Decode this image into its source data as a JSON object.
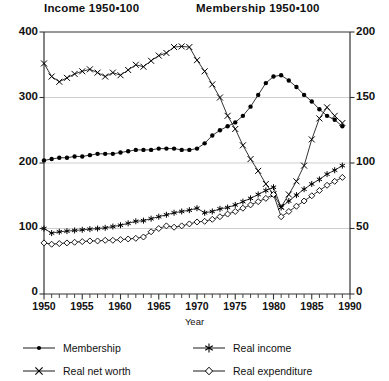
{
  "chart_data": {
    "type": "line",
    "title": "",
    "title_left": "Income 1950▪100",
    "title_right": "Membership 1950▪100",
    "xlabel": "Year",
    "ylabel_left": "Income 1950=100",
    "ylabel_right": "Membership 1950=100",
    "xlim": [
      1950,
      1990
    ],
    "ylim_left": [
      0,
      400
    ],
    "ylim_right": [
      0,
      200
    ],
    "yticks_left": [
      0,
      100,
      200,
      300,
      400
    ],
    "yticks_right": [
      0,
      50,
      100,
      150,
      200
    ],
    "xticks": [
      1950,
      1955,
      1960,
      1965,
      1970,
      1975,
      1980,
      1985,
      1990
    ],
    "xtick_minor_step": 1,
    "grid": true,
    "grid_axis": "y",
    "legend_position": "below",
    "x": [
      1950,
      1951,
      1952,
      1953,
      1954,
      1955,
      1956,
      1957,
      1958,
      1959,
      1960,
      1961,
      1962,
      1963,
      1964,
      1965,
      1966,
      1967,
      1968,
      1969,
      1970,
      1971,
      1972,
      1973,
      1974,
      1975,
      1976,
      1977,
      1978,
      1979,
      1980,
      1981,
      1982,
      1983,
      1984,
      1985,
      1986,
      1987,
      1988,
      1989
    ],
    "series": [
      {
        "name": "Membership",
        "marker": "filled-circle",
        "axis": "right",
        "values": [
          102,
          103,
          104,
          104,
          105,
          105,
          106,
          107,
          107,
          107,
          108,
          109,
          110,
          110,
          110,
          111,
          111,
          111,
          110,
          110,
          111,
          115,
          121,
          125,
          128,
          131,
          136,
          143,
          152,
          161,
          166,
          167,
          163,
          158,
          152,
          147,
          141,
          136,
          133,
          128
        ]
      },
      {
        "name": "Real net worth",
        "marker": "x",
        "axis": "left",
        "values": [
          352,
          332,
          324,
          330,
          336,
          340,
          343,
          338,
          332,
          338,
          334,
          342,
          350,
          347,
          356,
          364,
          368,
          377,
          378,
          377,
          357,
          340,
          320,
          300,
          272,
          252,
          227,
          206,
          188,
          168,
          152,
          133,
          152,
          172,
          196,
          236,
          268,
          285,
          272,
          261
        ]
      },
      {
        "name": "Real income",
        "marker": "asterisk",
        "axis": "left",
        "values": [
          100,
          93,
          95,
          96,
          97,
          98,
          99,
          100,
          101,
          103,
          105,
          108,
          111,
          112,
          115,
          118,
          121,
          124,
          126,
          128,
          131,
          124,
          126,
          130,
          132,
          136,
          141,
          146,
          152,
          158,
          163,
          132,
          142,
          151,
          160,
          168,
          175,
          183,
          189,
          196
        ]
      },
      {
        "name": "Real expenditure",
        "marker": "diamond",
        "axis": "left",
        "values": [
          78,
          76,
          77,
          78,
          79,
          80,
          81,
          81,
          82,
          82,
          83,
          84,
          85,
          87,
          95,
          100,
          104,
          102,
          104,
          107,
          110,
          111,
          114,
          118,
          122,
          126,
          131,
          136,
          141,
          146,
          152,
          118,
          126,
          134,
          142,
          150,
          158,
          166,
          172,
          178
        ]
      }
    ],
    "series_right_scaled_note": "Membership plotted on right axis (0-200); other three on left axis (0-400)"
  },
  "legend": {
    "items": [
      {
        "label": "Membership",
        "marker": "filled-circle"
      },
      {
        "label": "Real income",
        "marker": "asterisk"
      },
      {
        "label": "Real net worth",
        "marker": "x"
      },
      {
        "label": "Real expenditure",
        "marker": "diamond"
      }
    ]
  },
  "axes": {
    "left_ticks": [
      "400",
      "300",
      "200",
      "100",
      "0"
    ],
    "right_ticks": [
      "200",
      "150",
      "100",
      "50",
      "0"
    ],
    "x_ticks": [
      "1950",
      "1955",
      "1960",
      "1965",
      "1970",
      "1975",
      "1980",
      "1985",
      "1990"
    ],
    "x_title": "Year"
  }
}
